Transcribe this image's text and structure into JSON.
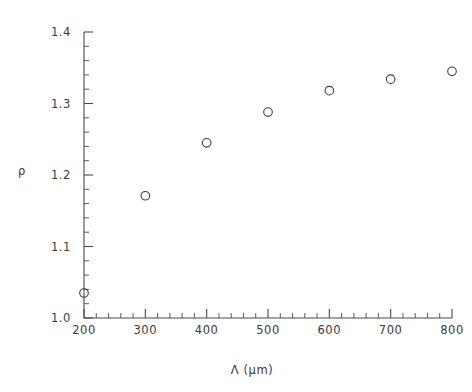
{
  "chart_data": {
    "type": "scatter",
    "title": "",
    "subtitle": "",
    "xlabel": "Λ  (μm)",
    "ylabel": "ρ",
    "xlim": [
      200,
      800
    ],
    "ylim": [
      1.0,
      1.4
    ],
    "grid": false,
    "legend": null,
    "x": [
      200,
      300,
      400,
      500,
      600,
      700,
      800
    ],
    "values": [
      1.035,
      1.171,
      1.245,
      1.288,
      1.318,
      1.334,
      1.345
    ],
    "series": [
      {
        "name": "ρ",
        "marker": "open-circle",
        "color": "#3c3c3c",
        "points": [
          {
            "x": 200,
            "y": 1.035
          },
          {
            "x": 300,
            "y": 1.171
          },
          {
            "x": 400,
            "y": 1.245
          },
          {
            "x": 500,
            "y": 1.288
          },
          {
            "x": 600,
            "y": 1.318
          },
          {
            "x": 700,
            "y": 1.334
          },
          {
            "x": 800,
            "y": 1.345
          }
        ]
      }
    ],
    "xticks": [
      200,
      300,
      400,
      500,
      600,
      700,
      800
    ],
    "xtick_labels": [
      "200",
      "300",
      "400",
      "500",
      "600",
      "700",
      "800"
    ],
    "x_minor_step": 20,
    "yticks": [
      1.0,
      1.1,
      1.2,
      1.3,
      1.4
    ],
    "ytick_labels": [
      "1.0",
      "1.1",
      "1.2",
      "1.3",
      "1.4"
    ],
    "y_minor_step": 0.02,
    "axis_color": "#4a4a4a",
    "background_color": "#ffffff"
  },
  "axes": {
    "x_axis_title": "Λ  (μm)",
    "y_axis_title": "ρ"
  }
}
